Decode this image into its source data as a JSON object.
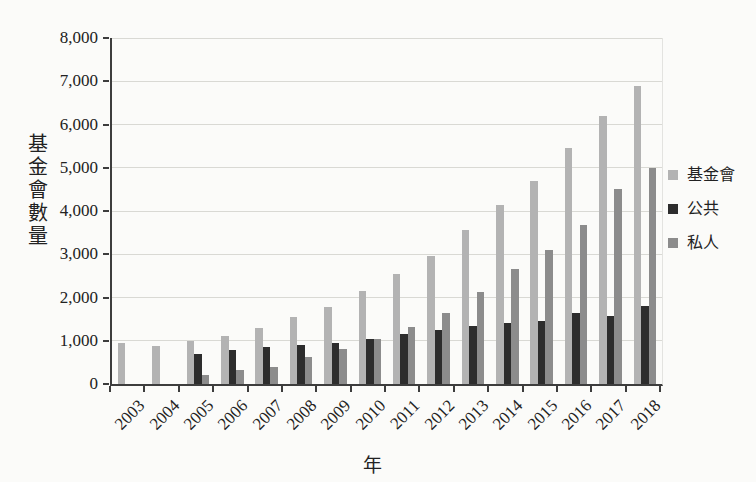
{
  "axes": {
    "y_title": "基金會數量",
    "x_title": "年"
  },
  "chart_data": {
    "type": "bar",
    "title": "",
    "xlabel": "年",
    "ylabel": "基金會數量",
    "ylim": [
      0,
      8000
    ],
    "ytick_step": 1000,
    "yticks": [
      "0",
      "1,000",
      "2,000",
      "3,000",
      "4,000",
      "5,000",
      "6,000",
      "7,000",
      "8,000"
    ],
    "grid": true,
    "legend_position": "right",
    "categories": [
      "2003",
      "2004",
      "2005",
      "2006",
      "2007",
      "2008",
      "2009",
      "2010",
      "2011",
      "2012",
      "2013",
      "2014",
      "2015",
      "2016",
      "2017",
      "2018"
    ],
    "series": [
      {
        "name": "基金會",
        "color": "#b3b3b3",
        "values": [
          950,
          880,
          1000,
          1120,
          1300,
          1550,
          1780,
          2150,
          2550,
          2950,
          3550,
          4150,
          4700,
          5450,
          6200,
          6900
        ]
      },
      {
        "name": "公共",
        "color": "#2d2d2d",
        "values": [
          0,
          0,
          700,
          780,
          850,
          900,
          950,
          1050,
          1150,
          1250,
          1350,
          1400,
          1450,
          1650,
          1570,
          1800
        ]
      },
      {
        "name": "私人",
        "color": "#8c8c8c",
        "values": [
          0,
          0,
          220,
          330,
          400,
          620,
          800,
          1050,
          1320,
          1650,
          2130,
          2650,
          3100,
          3680,
          4520,
          5000
        ]
      }
    ]
  }
}
